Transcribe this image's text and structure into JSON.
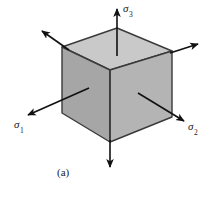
{
  "figure": {
    "caption": "(a)",
    "background_color": "#ffffff"
  },
  "labels": {
    "sigma3": {
      "symbol": "σ",
      "subscript": "3",
      "full": "σ3"
    },
    "sigma1": {
      "symbol": "σ",
      "subscript": "1",
      "full": "σ1"
    },
    "sigma2": {
      "symbol": "σ",
      "subscript": "2",
      "full": "σ2"
    }
  },
  "cube": {
    "top_face_color": "#c9c9c9",
    "left_face_color": "#a6a6a6",
    "right_face_color": "#b4b4b4",
    "edge_color": "#3a3a3a",
    "vertices": {
      "top_apex": [
        117,
        28
      ],
      "top_left": [
        62,
        47
      ],
      "top_right": [
        172,
        51
      ],
      "front_top": [
        110,
        70
      ],
      "bottom_left": [
        62,
        113
      ],
      "bottom_right": [
        172,
        117
      ],
      "bottom_front": [
        110,
        142
      ]
    }
  },
  "arrows": {
    "color": "#111111",
    "items": [
      {
        "name": "sigma3-up",
        "from": [
          117,
          55
        ],
        "to": [
          117,
          8
        ]
      },
      {
        "name": "sigma3-down",
        "from": [
          110,
          142
        ],
        "to": [
          110,
          168
        ]
      },
      {
        "name": "sigma1-out",
        "from": [
          88,
          89
        ],
        "to": [
          27,
          115
        ]
      },
      {
        "name": "sigma1-back",
        "from": [
          68,
          49
        ],
        "to": [
          42,
          31
        ]
      },
      {
        "name": "sigma2-out",
        "from": [
          139,
          94
        ],
        "to": [
          184,
          121
        ]
      },
      {
        "name": "sigma2-back",
        "from": [
          171,
          52
        ],
        "to": [
          198,
          44
        ]
      }
    ]
  }
}
